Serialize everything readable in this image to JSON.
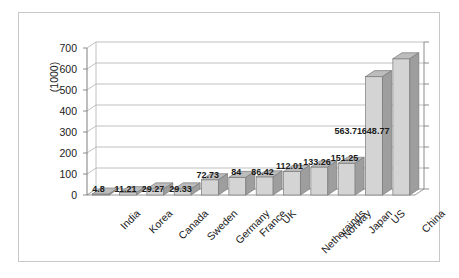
{
  "chart_data": {
    "type": "bar",
    "title": "",
    "subtitle": "",
    "xlabel": "",
    "ylabel": "(1000)",
    "ylim": [
      0,
      700
    ],
    "ytick_values": [
      0,
      100,
      200,
      300,
      400,
      500,
      600,
      700
    ],
    "ytick_labels": [
      "0",
      "100",
      "200",
      "300",
      "400",
      "500",
      "600",
      "700"
    ],
    "grid": true,
    "legend": "none",
    "style": "3d-column",
    "categories": [
      "India",
      "Korea",
      "Canada",
      "Sweden",
      "Germany",
      "France",
      "UK",
      "Netherainds",
      "Norway",
      "Japan",
      "US",
      "China"
    ],
    "values": [
      4.8,
      11.21,
      29.27,
      29.33,
      72.73,
      84,
      86.42,
      112.01,
      133.26,
      151.25,
      563.71,
      648.77
    ],
    "data_labels": [
      "4.8",
      "11.21",
      "29.27",
      "29.33",
      "72.73",
      "84",
      "86.42",
      "112.01",
      "133.26",
      "151.25",
      "563.71",
      "648.77"
    ],
    "series": [
      {
        "name": "",
        "values": [
          4.8,
          11.21,
          29.27,
          29.33,
          72.73,
          84,
          86.42,
          112.01,
          133.26,
          151.25,
          563.71,
          648.77
        ]
      }
    ]
  },
  "colors": {
    "bar_front": "#d4d4d4",
    "bar_top": "#bcbcbc",
    "bar_side": "#9e9e9e",
    "bar_edge": "#7a7a7a",
    "gridline": "#b0b0b0",
    "axis": "#7f7f7f",
    "frame": "#c8c8c8",
    "text": "#1a1a1a",
    "background": "#ffffff"
  }
}
